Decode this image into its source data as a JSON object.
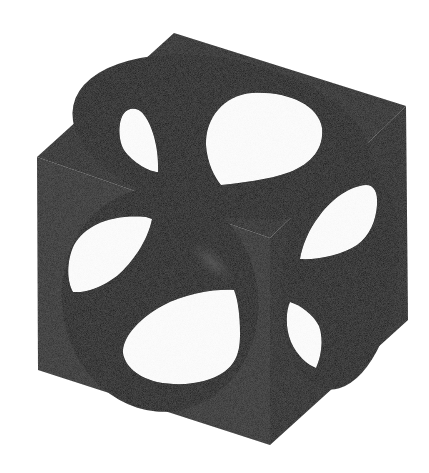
{
  "figure": {
    "colors": {
      "background": "#ffffff",
      "top_face": "#1e1e1e",
      "left_face": "#262626",
      "right_face": "#141414",
      "cavity": "#050505",
      "highlight": "#4a4a4a",
      "holes": "#ffffff"
    },
    "faces": [
      {
        "name": "top",
        "hole_count": 2
      },
      {
        "name": "left",
        "hole_count": 2
      },
      {
        "name": "right",
        "hole_count": 2
      }
    ]
  }
}
